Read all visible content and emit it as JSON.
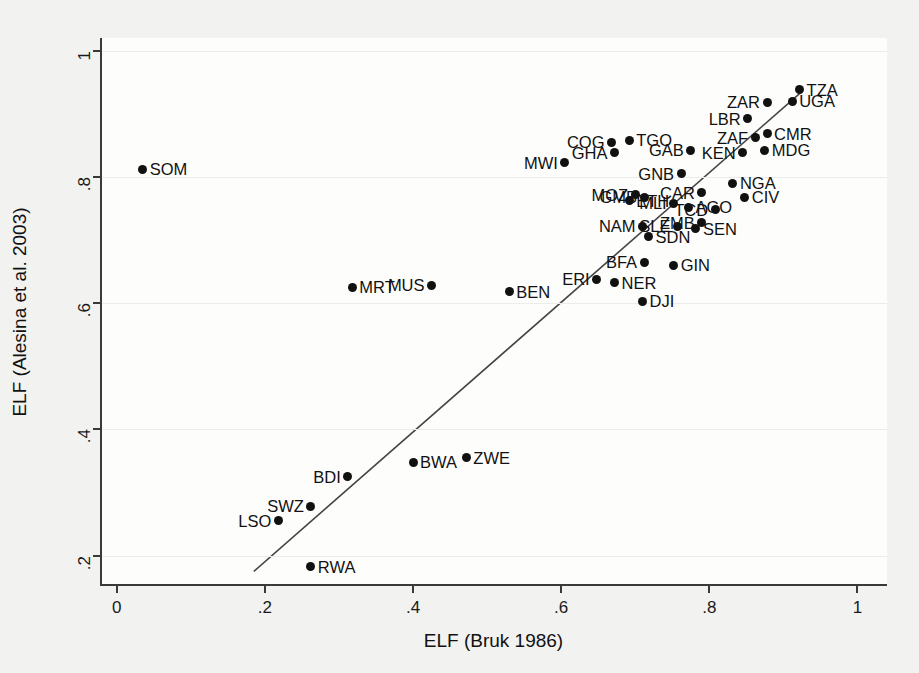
{
  "chart_data": {
    "type": "scatter",
    "title": "",
    "xlabel": "ELF (Bruk 1986)",
    "ylabel": "ELF (Alesina et al. 2003)",
    "xlim": [
      -0.02,
      1.04
    ],
    "ylim": [
      0.155,
      1.02
    ],
    "xticks": [
      "0",
      ".2",
      ".4",
      ".6",
      ".8",
      "1"
    ],
    "xtick_values": [
      0,
      0.2,
      0.4,
      0.6,
      0.8,
      1
    ],
    "yticks": [
      ".2",
      ".4",
      ".6",
      ".8",
      "1"
    ],
    "ytick_values": [
      0.2,
      0.4,
      0.6,
      0.8,
      1
    ],
    "grid": "horizontal",
    "legend": "none",
    "marker": "filled-circle",
    "marker_color": "#111111",
    "fitline": {
      "name": "linear fit",
      "x0": 0.185,
      "y0": 0.175,
      "x1": 0.925,
      "y1": 0.935,
      "color": "#444444"
    },
    "points": [
      {
        "label": "SOM",
        "x": 0.035,
        "y": 0.812,
        "side": "right"
      },
      {
        "label": "MRT",
        "x": 0.318,
        "y": 0.625,
        "side": "right"
      },
      {
        "label": "MUS",
        "x": 0.425,
        "y": 0.628,
        "side": "left"
      },
      {
        "label": "BEN",
        "x": 0.53,
        "y": 0.618,
        "side": "right"
      },
      {
        "label": "ERI",
        "x": 0.648,
        "y": 0.638,
        "side": "left"
      },
      {
        "label": "NER",
        "x": 0.672,
        "y": 0.632,
        "side": "right"
      },
      {
        "label": "DJI",
        "x": 0.71,
        "y": 0.603,
        "side": "right"
      },
      {
        "label": "BFA",
        "x": 0.712,
        "y": 0.665,
        "side": "left"
      },
      {
        "label": "GIN",
        "x": 0.752,
        "y": 0.66,
        "side": "right"
      },
      {
        "label": "NAM",
        "x": 0.71,
        "y": 0.722,
        "side": "left"
      },
      {
        "label": "SDN",
        "x": 0.718,
        "y": 0.705,
        "side": "right"
      },
      {
        "label": "SLE",
        "x": 0.757,
        "y": 0.722,
        "side": "left"
      },
      {
        "label": "SEN",
        "x": 0.782,
        "y": 0.718,
        "side": "right"
      },
      {
        "label": "ZMB",
        "x": 0.79,
        "y": 0.727,
        "side": "left"
      },
      {
        "label": "ETH",
        "x": 0.692,
        "y": 0.762,
        "side": "right"
      },
      {
        "label": "MOZ",
        "x": 0.7,
        "y": 0.772,
        "side": "left"
      },
      {
        "label": "GMB",
        "x": 0.712,
        "y": 0.768,
        "side": "left"
      },
      {
        "label": "MLI",
        "x": 0.752,
        "y": 0.758,
        "side": "left"
      },
      {
        "label": "AGO",
        "x": 0.772,
        "y": 0.752,
        "side": "right"
      },
      {
        "label": "TCD",
        "x": 0.808,
        "y": 0.748,
        "side": "left"
      },
      {
        "label": "CAR",
        "x": 0.79,
        "y": 0.775,
        "side": "left"
      },
      {
        "label": "CIV",
        "x": 0.848,
        "y": 0.768,
        "side": "right"
      },
      {
        "label": "NGA",
        "x": 0.832,
        "y": 0.79,
        "side": "right"
      },
      {
        "label": "GNB",
        "x": 0.762,
        "y": 0.805,
        "side": "left"
      },
      {
        "label": "MWI",
        "x": 0.605,
        "y": 0.822,
        "side": "left"
      },
      {
        "label": "GHA",
        "x": 0.672,
        "y": 0.838,
        "side": "left"
      },
      {
        "label": "GAB",
        "x": 0.775,
        "y": 0.842,
        "side": "left"
      },
      {
        "label": "KEN",
        "x": 0.845,
        "y": 0.838,
        "side": "left"
      },
      {
        "label": "MDG",
        "x": 0.875,
        "y": 0.842,
        "side": "right"
      },
      {
        "label": "COG",
        "x": 0.668,
        "y": 0.855,
        "side": "left"
      },
      {
        "label": "TGO",
        "x": 0.692,
        "y": 0.858,
        "side": "right"
      },
      {
        "label": "ZAF",
        "x": 0.862,
        "y": 0.862,
        "side": "left"
      },
      {
        "label": "CMR",
        "x": 0.878,
        "y": 0.868,
        "side": "right"
      },
      {
        "label": "LBR",
        "x": 0.852,
        "y": 0.892,
        "side": "left"
      },
      {
        "label": "ZAR",
        "x": 0.878,
        "y": 0.918,
        "side": "left"
      },
      {
        "label": "UGA",
        "x": 0.912,
        "y": 0.92,
        "side": "right"
      },
      {
        "label": "TZA",
        "x": 0.922,
        "y": 0.938,
        "side": "right"
      },
      {
        "label": "ZWE",
        "x": 0.472,
        "y": 0.355,
        "side": "right"
      },
      {
        "label": "BWA",
        "x": 0.4,
        "y": 0.348,
        "side": "right"
      },
      {
        "label": "BDI",
        "x": 0.312,
        "y": 0.325,
        "side": "left"
      },
      {
        "label": "SWZ",
        "x": 0.262,
        "y": 0.278,
        "side": "left"
      },
      {
        "label": "LSO",
        "x": 0.218,
        "y": 0.255,
        "side": "left"
      },
      {
        "label": "RWA",
        "x": 0.262,
        "y": 0.182,
        "side": "right"
      }
    ]
  }
}
